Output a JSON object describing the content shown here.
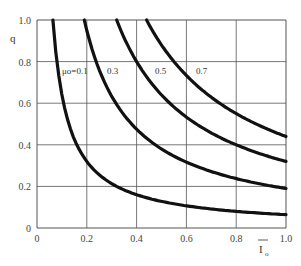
{
  "chart_data": {
    "type": "line",
    "title": "",
    "xlabel": "I̅o",
    "ylabel": "q",
    "xlim": [
      0,
      1.0
    ],
    "ylim": [
      0,
      1.0
    ],
    "grid": true,
    "xticks": [
      "0",
      "0.2",
      "0.4",
      "0.6",
      "0.8",
      "1.0"
    ],
    "yticks": [
      "0",
      "0.2",
      "0.4",
      "0.6",
      "0.8",
      "1.0"
    ],
    "series": [
      {
        "name": "μo=0.1",
        "label": "μo=0.1",
        "k": 0.064,
        "x": [
          0.064,
          0.1,
          0.2,
          0.3,
          0.4,
          0.6,
          0.8,
          1.0
        ],
        "values": [
          1.0,
          0.64,
          0.32,
          0.21,
          0.16,
          0.11,
          0.08,
          0.064
        ]
      },
      {
        "name": "0.3",
        "label": "0.3",
        "k": 0.19,
        "x": [
          0.19,
          0.2,
          0.3,
          0.4,
          0.6,
          0.8,
          1.0
        ],
        "values": [
          1.0,
          0.95,
          0.63,
          0.48,
          0.32,
          0.24,
          0.19
        ]
      },
      {
        "name": "0.5",
        "label": "0.5",
        "k": 0.32,
        "x": [
          0.32,
          0.4,
          0.6,
          0.8,
          1.0
        ],
        "values": [
          1.0,
          0.8,
          0.53,
          0.4,
          0.32
        ]
      },
      {
        "name": "0.7",
        "label": "0.7",
        "k": 0.44,
        "x": [
          0.44,
          0.6,
          0.8,
          1.0
        ],
        "values": [
          1.0,
          0.73,
          0.55,
          0.44
        ]
      }
    ],
    "annotations": [
      "μo=0.1",
      "0.3",
      "0.5",
      "0.7"
    ]
  },
  "axes": {
    "x_label_main": "I",
    "x_label_sub": "o",
    "y_label": "q"
  }
}
